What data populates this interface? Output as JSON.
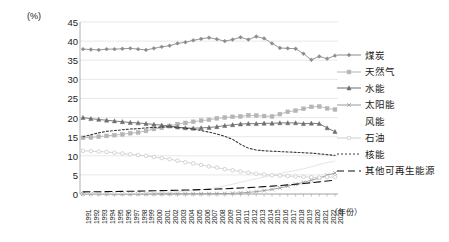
{
  "axis": {
    "unit_label": "(%)",
    "x_axis_title": "（年份）",
    "y_ticks": [
      "45",
      "40",
      "35",
      "30",
      "25",
      "20",
      "15",
      "10",
      "5",
      "0"
    ]
  },
  "legend": {
    "items": [
      {
        "label": "煤炭",
        "icon": "line-marker-diamond",
        "color": "#8c8c8c",
        "dash": "none"
      },
      {
        "label": "天然气",
        "icon": "line-marker-square",
        "color": "#b5b5b5",
        "dash": "none"
      },
      {
        "label": "水能",
        "icon": "line-marker-triangle",
        "color": "#6e6e6e",
        "dash": "none"
      },
      {
        "label": "太阳能",
        "icon": "line-marker-cross",
        "color": "#9a9a9a",
        "dash": "none"
      },
      {
        "label": "风能",
        "icon": "line-marker-none",
        "color": "#e2e2e2",
        "dash": "none"
      },
      {
        "label": "石油",
        "icon": "line-marker-circle",
        "color": "#cfcfcf",
        "dash": "none"
      },
      {
        "label": "核能",
        "icon": "line-dotted",
        "color": "#3a3a3a",
        "dash": "2,2"
      },
      {
        "label": "其他可再生能源",
        "icon": "line-dashed",
        "color": "#111111",
        "dash": "7,4"
      }
    ]
  },
  "chart_data": {
    "type": "line",
    "title": "",
    "xlabel": "（年份）",
    "ylabel": "(%)",
    "ylim": [
      0,
      45
    ],
    "ytick_step": 5,
    "grid": true,
    "legend_position": "right",
    "x": [
      "1991",
      "1992",
      "1993",
      "1994",
      "1995",
      "1996",
      "1997",
      "1998",
      "1999",
      "2000",
      "2001",
      "2002",
      "2003",
      "2004",
      "2005",
      "2006",
      "2007",
      "2008",
      "2009",
      "2010",
      "2011",
      "2012",
      "2013",
      "2014",
      "2015",
      "2016",
      "2017",
      "2018",
      "2019",
      "2020",
      "2021",
      "2022",
      "2023"
    ],
    "series": [
      {
        "name": "煤炭",
        "color": "#8c8c8c",
        "marker": "diamond",
        "dash": "none",
        "values": [
          37.9,
          37.8,
          37.7,
          37.9,
          37.9,
          38.0,
          38.1,
          37.9,
          37.7,
          38.1,
          38.5,
          38.8,
          39.4,
          39.7,
          40.2,
          40.6,
          40.9,
          40.5,
          40.0,
          40.4,
          41.0,
          40.4,
          41.2,
          40.7,
          39.4,
          38.2,
          38.1,
          38.0,
          36.7,
          35.1,
          36.0,
          35.4,
          36.2
        ]
      },
      {
        "name": "天然气",
        "color": "#b5b5b5",
        "marker": "square",
        "dash": "none",
        "values": [
          14.7,
          14.8,
          15.0,
          15.2,
          15.4,
          15.6,
          15.9,
          16.1,
          16.5,
          17.0,
          17.3,
          17.8,
          18.3,
          18.6,
          18.9,
          19.2,
          19.4,
          19.8,
          20.0,
          20.2,
          20.3,
          20.6,
          20.5,
          20.4,
          20.3,
          20.9,
          21.5,
          21.8,
          22.3,
          22.8,
          22.9,
          22.4,
          22.1
        ]
      },
      {
        "name": "水能",
        "color": "#6e6e6e",
        "marker": "triangle",
        "dash": "none",
        "values": [
          20.0,
          19.7,
          19.5,
          19.3,
          19.1,
          18.9,
          18.7,
          18.6,
          18.4,
          18.2,
          18.0,
          17.8,
          17.5,
          17.3,
          17.2,
          17.3,
          17.4,
          17.6,
          17.9,
          18.1,
          18.3,
          18.4,
          18.4,
          18.5,
          18.5,
          18.6,
          18.6,
          18.6,
          18.4,
          18.5,
          18.4,
          17.3,
          16.3
        ]
      },
      {
        "name": "太阳能",
        "color": "#9a9a9a",
        "marker": "cross",
        "dash": "none",
        "values": [
          0.0,
          0.0,
          0.0,
          0.0,
          0.0,
          0.0,
          0.0,
          0.01,
          0.01,
          0.01,
          0.01,
          0.02,
          0.02,
          0.03,
          0.04,
          0.05,
          0.07,
          0.09,
          0.12,
          0.18,
          0.28,
          0.43,
          0.62,
          0.89,
          1.2,
          1.6,
          2.05,
          2.55,
          3.05,
          3.6,
          4.2,
          4.9,
          5.5
        ]
      },
      {
        "name": "风能",
        "color": "#e2e2e2",
        "marker": "none",
        "dash": "none",
        "values": [
          0.05,
          0.06,
          0.07,
          0.09,
          0.11,
          0.13,
          0.16,
          0.2,
          0.25,
          0.31,
          0.4,
          0.5,
          0.62,
          0.75,
          0.92,
          1.12,
          1.38,
          1.7,
          2.1,
          2.55,
          3.05,
          3.55,
          4.0,
          4.45,
          4.9,
          5.35,
          5.8,
          6.2,
          6.6,
          7.1,
          7.7,
          8.2,
          8.6
        ]
      },
      {
        "name": "石油",
        "color": "#cfcfcf",
        "marker": "circle",
        "dash": "none",
        "values": [
          11.3,
          11.2,
          11.1,
          11.0,
          10.8,
          10.6,
          10.4,
          10.2,
          10.0,
          9.7,
          9.4,
          9.1,
          8.7,
          8.3,
          8.0,
          7.6,
          7.2,
          6.9,
          6.5,
          6.2,
          5.9,
          5.6,
          5.3,
          5.1,
          4.9,
          4.8,
          4.7,
          4.6,
          4.5,
          4.4,
          4.3,
          4.4,
          4.4
        ]
      },
      {
        "name": "核能",
        "color": "#3a3a3a",
        "marker": "none",
        "dash": "2,2",
        "values": [
          15.0,
          15.5,
          16.0,
          16.4,
          16.6,
          16.8,
          17.0,
          17.1,
          17.3,
          17.4,
          17.5,
          17.6,
          17.4,
          17.2,
          17.0,
          16.6,
          16.2,
          15.7,
          15.1,
          14.3,
          13.0,
          12.0,
          11.5,
          11.3,
          11.2,
          11.1,
          11.0,
          10.9,
          10.8,
          10.7,
          10.5,
          10.3,
          10.1
        ]
      },
      {
        "name": "其他可再生能源",
        "color": "#111111",
        "marker": "none",
        "dash": "7,4",
        "values": [
          0.55,
          0.58,
          0.6,
          0.63,
          0.66,
          0.69,
          0.72,
          0.76,
          0.8,
          0.84,
          0.88,
          0.93,
          0.98,
          1.03,
          1.09,
          1.15,
          1.22,
          1.3,
          1.38,
          1.47,
          1.57,
          1.68,
          1.8,
          1.93,
          2.07,
          2.22,
          2.38,
          2.55,
          2.74,
          2.94,
          3.16,
          3.4,
          3.65
        ]
      }
    ]
  }
}
